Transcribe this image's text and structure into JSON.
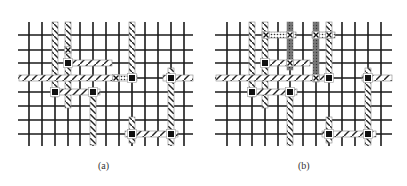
{
  "figure": {
    "panels": [
      {
        "id": "a",
        "caption": "(a)",
        "caption_pos": [
          98,
          168
        ],
        "grid": {
          "x_lines": [
            29,
            42,
            55,
            68,
            80,
            93,
            106,
            119,
            132,
            145,
            158,
            171,
            184
          ],
          "y_lines": [
            35,
            50,
            63,
            78,
            92,
            106,
            120,
            134
          ],
          "x_range": [
            18,
            193
          ],
          "y_range": [
            22,
            146
          ]
        },
        "hatched_wires": [
          {
            "orient": "v",
            "at": 55,
            "from": 22,
            "to": 97
          },
          {
            "orient": "v",
            "at": 68,
            "from": 22,
            "to": 108
          },
          {
            "orient": "h",
            "at": 63,
            "from": 65,
            "to": 112
          },
          {
            "orient": "h",
            "at": 78,
            "from": 19,
            "to": 117
          },
          {
            "orient": "v",
            "at": 132,
            "from": 22,
            "to": 80
          },
          {
            "orient": "h",
            "at": 92,
            "from": 51,
            "to": 100
          },
          {
            "orient": "v",
            "at": 93,
            "from": 89,
            "to": 145
          },
          {
            "orient": "h",
            "at": 78,
            "from": 163,
            "to": 193
          },
          {
            "orient": "v",
            "at": 171,
            "from": 68,
            "to": 145
          },
          {
            "orient": "h",
            "at": 134,
            "from": 125,
            "to": 178
          },
          {
            "orient": "v",
            "at": 132,
            "from": 117,
            "to": 143
          }
        ],
        "dotted_wires": [
          {
            "orient": "h",
            "at": 78,
            "from": 116,
            "to": 137
          }
        ],
        "grey_wires": [],
        "vias": [
          [
            68,
            63
          ],
          [
            55,
            92
          ],
          [
            93,
            92
          ],
          [
            132,
            78
          ],
          [
            171,
            78
          ],
          [
            132,
            134
          ],
          [
            171,
            134
          ]
        ],
        "crosses": [
          [
            68,
            50
          ],
          [
            116,
            78
          ]
        ]
      },
      {
        "id": "b",
        "caption": "(b)",
        "caption_pos": [
          298,
          168
        ],
        "grid": {
          "x_lines": [
            227,
            240,
            252,
            265,
            278,
            290,
            303,
            316,
            329,
            342,
            355,
            368,
            381
          ],
          "y_lines": [
            35,
            50,
            63,
            78,
            92,
            106,
            120,
            134
          ],
          "x_range": [
            215,
            392
          ],
          "y_range": [
            22,
            146
          ]
        },
        "hatched_wires": [
          {
            "orient": "v",
            "at": 252,
            "from": 22,
            "to": 97
          },
          {
            "orient": "v",
            "at": 265,
            "from": 22,
            "to": 108
          },
          {
            "orient": "h",
            "at": 63,
            "from": 262,
            "to": 310
          },
          {
            "orient": "h",
            "at": 78,
            "from": 216,
            "to": 330
          },
          {
            "orient": "v",
            "at": 329,
            "from": 22,
            "to": 80
          },
          {
            "orient": "h",
            "at": 92,
            "from": 248,
            "to": 297
          },
          {
            "orient": "v",
            "at": 290,
            "from": 89,
            "to": 145
          },
          {
            "orient": "h",
            "at": 78,
            "from": 362,
            "to": 392
          },
          {
            "orient": "v",
            "at": 368,
            "from": 68,
            "to": 145
          },
          {
            "orient": "h",
            "at": 134,
            "from": 322,
            "to": 376
          },
          {
            "orient": "v",
            "at": 329,
            "from": 117,
            "to": 143
          }
        ],
        "dotted_wires": [
          {
            "orient": "h",
            "at": 35,
            "from": 262,
            "to": 296
          },
          {
            "orient": "h",
            "at": 35,
            "from": 312,
            "to": 335
          }
        ],
        "grey_wires": [
          {
            "orient": "v",
            "at": 290,
            "from": 22,
            "to": 70
          },
          {
            "orient": "v",
            "at": 316,
            "from": 22,
            "to": 82
          }
        ],
        "vias": [
          [
            265,
            63
          ],
          [
            252,
            92
          ],
          [
            290,
            92
          ],
          [
            329,
            78
          ],
          [
            368,
            78
          ],
          [
            329,
            134
          ],
          [
            368,
            134
          ]
        ],
        "crosses": [
          [
            266,
            35
          ],
          [
            290,
            35
          ],
          [
            316,
            35
          ],
          [
            329,
            35
          ],
          [
            290,
            63
          ],
          [
            316,
            78
          ]
        ]
      }
    ],
    "colors": {
      "grid": "#1a1a1a",
      "hatch_fill": "#ffffff",
      "hatch_stroke": "#222222",
      "grey_wire": "#666666",
      "via": "#111111"
    }
  }
}
